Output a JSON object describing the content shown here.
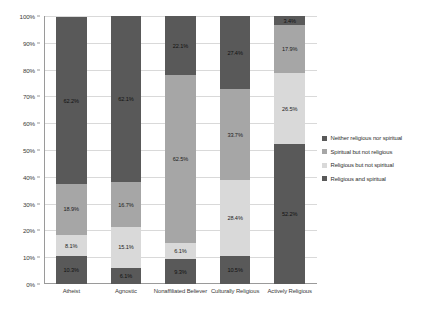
{
  "chart_data": {
    "type": "bar",
    "subtype": "stacked-100-percent",
    "title": "",
    "xlabel": "",
    "ylabel": "",
    "ylim": [
      0,
      100
    ],
    "ytick_labels": [
      "0%",
      "10%",
      "20%",
      "30%",
      "40%",
      "50%",
      "60%",
      "70%",
      "80%",
      "90%",
      "100%"
    ],
    "ytick_values": [
      0,
      10,
      20,
      30,
      40,
      50,
      60,
      70,
      80,
      90,
      100
    ],
    "grid": true,
    "legend_position": "right",
    "categories": [
      "Atheist",
      "Agnostic",
      "Nonaffiliated Believer",
      "Culturally Religious",
      "Actively Religious"
    ],
    "series": [
      {
        "name": "Religious and spiritual",
        "color": "#595959",
        "values": [
          10.3,
          6.1,
          9.3,
          10.5,
          52.2
        ],
        "labels": [
          "10.3%",
          "6.1%",
          "9.3%",
          "10.5%",
          "52.2%"
        ]
      },
      {
        "name": "Religious but not spiritual",
        "color": "#d9d9d9",
        "values": [
          8.1,
          15.1,
          6.1,
          28.4,
          26.5
        ],
        "labels": [
          "8.1%",
          "15.1%",
          "6.1%",
          "28.4%",
          "26.5%"
        ]
      },
      {
        "name": "Spiritual but not religious",
        "color": "#a6a6a6",
        "values": [
          18.9,
          16.7,
          62.5,
          33.7,
          17.9
        ],
        "labels": [
          "18.9%",
          "16.7%",
          "62.5%",
          "33.7%",
          "17.9%"
        ]
      },
      {
        "name": "Neither religious nor spiritual",
        "color": "#595959",
        "values": [
          62.2,
          62.1,
          22.1,
          27.4,
          3.4
        ],
        "labels": [
          "62.2%",
          "62.1%",
          "22.1%",
          "27.4%",
          "3.4%"
        ]
      }
    ]
  },
  "legend": {
    "items": [
      {
        "label": "Neither religious nor spiritual",
        "color": "#595959"
      },
      {
        "label": "Spiritual but not religious",
        "color": "#a6a6a6"
      },
      {
        "label": "Religious but not spiritual",
        "color": "#d9d9d9"
      },
      {
        "label": "Religious and spiritual",
        "color": "#595959"
      }
    ]
  }
}
